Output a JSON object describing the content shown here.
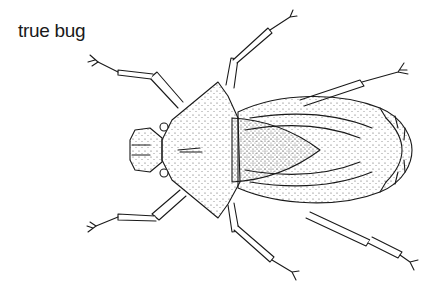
{
  "caption": "true bug",
  "colors": {
    "ink": "#1a1a1a",
    "background": "#ffffff",
    "stipple": "#555555"
  }
}
